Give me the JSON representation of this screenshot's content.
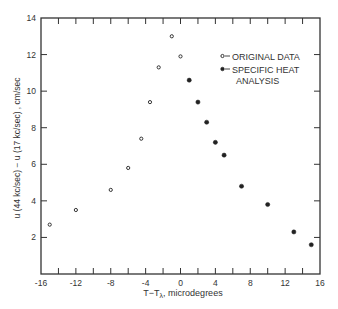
{
  "chart_data": {
    "type": "scatter",
    "title": "",
    "xlabel": "T−Tλ, microdegrees",
    "xlabel_main": "T−T",
    "xlabel_sub": "λ",
    "xlabel_rest": ", microdegrees",
    "ylabel": "u (44 kc/sec) − u (17 kc/sec) , cm/sec",
    "xlim": [
      -16,
      16
    ],
    "ylim": [
      0,
      14
    ],
    "xticks": [
      -16,
      -12,
      -8,
      -4,
      0,
      4,
      8,
      12,
      16
    ],
    "xtick_labels": [
      "-16",
      "-12",
      "-8",
      "-4",
      "0",
      "4",
      "8",
      "12",
      "16"
    ],
    "xminor_step": 2,
    "yticks": [
      2,
      4,
      6,
      8,
      10,
      12,
      14
    ],
    "ytick_labels": [
      "2",
      "4",
      "6",
      "8",
      "10",
      "12",
      "14"
    ],
    "grid": false,
    "legend_position": "upper right",
    "series": [
      {
        "name": "ORIGINAL DATA",
        "marker": "open-circle",
        "x": [
          -15,
          -12,
          -8,
          -6,
          -4.5,
          -3.5,
          -2.5,
          -1,
          0
        ],
        "y": [
          2.7,
          3.5,
          4.6,
          5.8,
          7.4,
          9.4,
          11.3,
          13.0,
          11.9
        ]
      },
      {
        "name": "SPECIFIC HEAT ANALYSIS",
        "legend_lines": [
          "SPECIFIC HEAT",
          "ANALYSIS"
        ],
        "marker": "filled-circle",
        "x": [
          1,
          2,
          3,
          4,
          5,
          7,
          10,
          13,
          15
        ],
        "y": [
          10.6,
          9.4,
          8.3,
          7.2,
          6.5,
          4.8,
          3.8,
          2.3,
          1.6
        ]
      }
    ]
  }
}
